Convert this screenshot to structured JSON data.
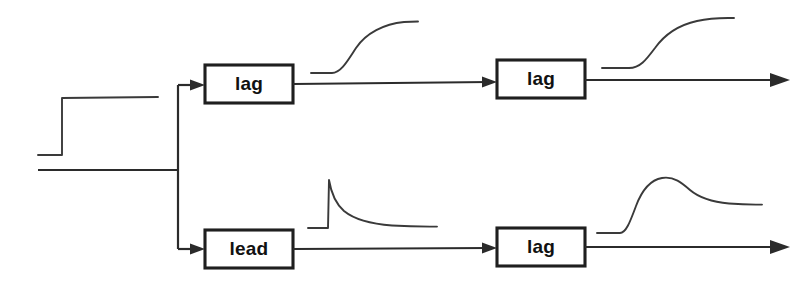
{
  "diagram": {
    "background_color": "#ffffff",
    "line_color": "#2b2b2b",
    "trace_color": "#3a3a3a",
    "block_border_color": "#1f1f1f",
    "label_color": "#111111",
    "blocks": [
      {
        "id": "top-first",
        "label": "lag",
        "x": 205,
        "y": 65,
        "w": 88,
        "h": 38
      },
      {
        "id": "top-second",
        "label": "lag",
        "x": 497,
        "y": 60,
        "w": 88,
        "h": 38
      },
      {
        "id": "bottom-first",
        "label": "lead",
        "x": 205,
        "y": 230,
        "w": 88,
        "h": 38
      },
      {
        "id": "bottom-second",
        "label": "lag",
        "x": 497,
        "y": 228,
        "w": 88,
        "h": 38
      }
    ],
    "signals": [
      {
        "id": "input-step",
        "name": "step-input-trace",
        "description": "step change input"
      },
      {
        "id": "top-after-lag-1",
        "name": "first-order-lag-response",
        "description": "exponential rise to new steady state"
      },
      {
        "id": "top-after-lag-2",
        "name": "second-order-lag-response",
        "description": "S-shaped sigmoid rise"
      },
      {
        "id": "bottom-after-lead",
        "name": "lead-response",
        "description": "sharp spike then exponential decay"
      },
      {
        "id": "bottom-after-lag",
        "name": "lead-lag-response",
        "description": "fast rise, overshoot peak, then settle"
      }
    ]
  }
}
